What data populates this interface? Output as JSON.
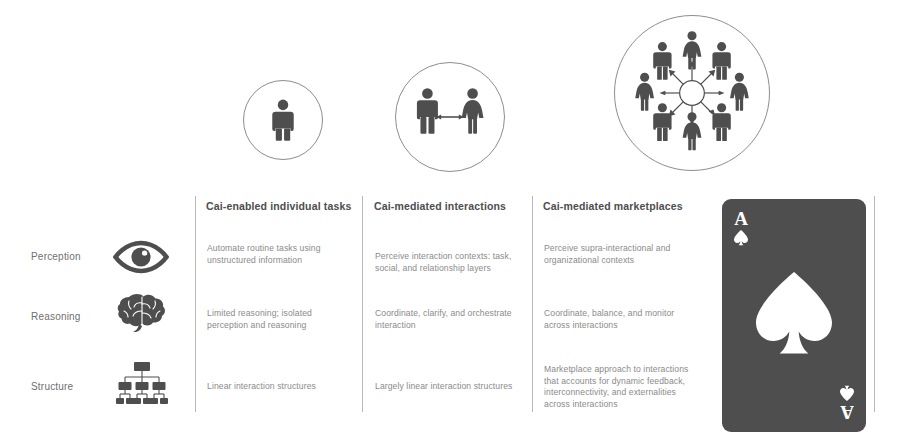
{
  "diagram": {
    "colors": {
      "figure": "#4e4e4e",
      "circle_outline": "#8d8d8d",
      "divider": "#b9b9b9",
      "header_text": "#4d4d4d",
      "body_text": "#8a8a8a",
      "row_label_text": "#6f6f6f",
      "card_face": "#4e4e4e",
      "card_pip": "#ffffff",
      "background": "#ffffff"
    },
    "stages": [
      {
        "id": "individual",
        "icon": "single-person-icon",
        "figures": 1
      },
      {
        "id": "interaction",
        "icon": "two-people-arrow-icon",
        "figures": 2
      },
      {
        "id": "marketplace",
        "icon": "network-of-people-icon",
        "figures": 8
      }
    ],
    "columns": [
      {
        "header": "Cai-enabled individual tasks"
      },
      {
        "header": "Cai-mediated interactions"
      },
      {
        "header": "Cai-mediated marketplaces"
      }
    ],
    "rows": [
      {
        "label": "Perception",
        "icon": "eye-icon",
        "cells": [
          "Automate routine tasks using unstructured information",
          "Perceive interaction contexts: task, social, and relationship layers",
          "Perceive supra-interactional and organizational contexts"
        ]
      },
      {
        "label": "Reasoning",
        "icon": "brain-icon",
        "cells": [
          "Limited reasoning; isolated perception and reasoning",
          "Coordinate, clarify, and orchestrate interaction",
          "Coordinate, balance, and monitor across interactions"
        ]
      },
      {
        "label": "Structure",
        "icon": "org-chart-icon",
        "cells": [
          "Linear interaction structures",
          "Largely linear interaction structures",
          "Marketplace approach to interactions that accounts for dynamic feedback, interconnectivity, and externalities across interactions"
        ]
      }
    ],
    "card": {
      "rank": "A",
      "suit": "spade",
      "suit_icon": "spade-icon"
    }
  }
}
